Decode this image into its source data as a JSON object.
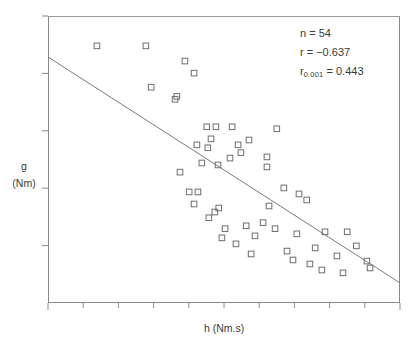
{
  "chart_data": {
    "type": "scatter",
    "title": "",
    "xlabel": "h  (Nm.s)",
    "ylabel_line1": "g",
    "ylabel_line2": "(Nm)",
    "xlim": [
      0,
      10
    ],
    "ylim": [
      0,
      10
    ],
    "grid": false,
    "legend": "none",
    "marker": "open-square",
    "marker_color": "#6e6e6e",
    "line_color": "#7a7a7a",
    "n_points": 54,
    "annotations": {
      "n_label": "n = 54",
      "r_label": "r = −0.637",
      "r_crit_prefix": "r",
      "r_crit_subscript": "0.001",
      "r_crit_value": " = 0.443"
    },
    "regression_line": {
      "x": [
        0.0,
        10.0
      ],
      "y": [
        8.57,
        0.7
      ]
    },
    "x": [
      1.39,
      2.78,
      3.89,
      4.15,
      2.93,
      3.66,
      3.61,
      4.51,
      4.77,
      5.23,
      4.63,
      4.23,
      4.54,
      5.4,
      5.71,
      5.48,
      5.17,
      4.37,
      4.83,
      6.5,
      6.22,
      6.22,
      6.7,
      7.13,
      7.35,
      6.28,
      4.01,
      4.26,
      4.15,
      4.85,
      4.74,
      4.57,
      5.03,
      5.63,
      5.88,
      4.94,
      5.34,
      6.11,
      6.45,
      7.07,
      7.87,
      8.5,
      8.76,
      8.21,
      7.59,
      6.96,
      7.78,
      8.38,
      9.15,
      9.06,
      5.77,
      6.79,
      7.44,
      3.75
    ],
    "y": [
      8.96,
      8.96,
      8.43,
      8.01,
      7.52,
      7.2,
      7.1,
      6.14,
      6.14,
      6.14,
      5.72,
      5.51,
      5.41,
      5.51,
      5.68,
      5.24,
      5.05,
      4.88,
      4.81,
      6.07,
      5.09,
      4.74,
      4.01,
      3.8,
      3.59,
      3.38,
      3.87,
      3.87,
      3.45,
      3.31,
      3.17,
      2.97,
      2.59,
      2.69,
      2.34,
      2.27,
      2.06,
      2.8,
      2.59,
      2.41,
      2.48,
      2.48,
      1.99,
      1.64,
      1.92,
      1.5,
      1.15,
      1.05,
      1.22,
      1.46,
      1.71,
      1.81,
      1.36,
      4.56
    ]
  },
  "figure": {
    "top_caption_remnant": ""
  }
}
